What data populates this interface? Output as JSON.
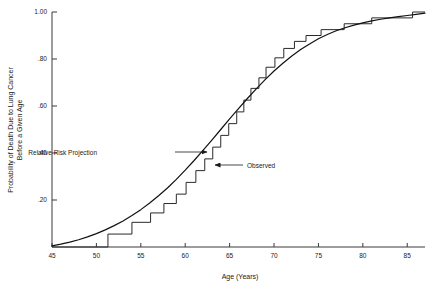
{
  "chart_data": {
    "type": "line",
    "title": "",
    "xlabel": "Age (Years)",
    "ylabel": "Probability of Death Due to Lung Cancer Before a Given Age",
    "ylabel_line1": "Probability of Death Due to Lung Cancer",
    "ylabel_line2": "Before a Given Age",
    "xlim": [
      45,
      87
    ],
    "ylim": [
      0,
      1.0
    ],
    "grid": false,
    "legend_position": "none",
    "xticks": [
      45,
      50,
      55,
      60,
      65,
      70,
      75,
      80,
      85
    ],
    "xtick_labels": [
      "45",
      "50",
      "55",
      "60",
      "65",
      "70",
      "75",
      "80",
      "85"
    ],
    "yticks": [
      0.2,
      0.4,
      0.6,
      0.8,
      1.0
    ],
    "ytick_labels": [
      ".20",
      ".40",
      ".60",
      ".80",
      "1.00"
    ],
    "series": [
      {
        "name": "Relative Risk Projection",
        "style": "smooth",
        "color": "#111111",
        "x": [
          45,
          46,
          47,
          48,
          49,
          50,
          51,
          52,
          53,
          54,
          55,
          56,
          57,
          58,
          59,
          60,
          61,
          62,
          63,
          64,
          65,
          66,
          67,
          68,
          69,
          70,
          71,
          72,
          73,
          74,
          75,
          76,
          77,
          78,
          79,
          80,
          81,
          82,
          83,
          84,
          85,
          86,
          87
        ],
        "y": [
          0.005,
          0.012,
          0.021,
          0.031,
          0.043,
          0.057,
          0.073,
          0.091,
          0.111,
          0.134,
          0.159,
          0.187,
          0.218,
          0.251,
          0.288,
          0.327,
          0.368,
          0.411,
          0.455,
          0.5,
          0.545,
          0.589,
          0.632,
          0.673,
          0.712,
          0.749,
          0.782,
          0.813,
          0.84,
          0.864,
          0.886,
          0.904,
          0.92,
          0.933,
          0.944,
          0.954,
          0.962,
          0.969,
          0.975,
          0.98,
          0.985,
          0.99,
          0.995
        ]
      },
      {
        "name": "Observed",
        "style": "step",
        "color": "#2a2a2a",
        "x": [
          45,
          51.3,
          51.3,
          54.0,
          54.0,
          56.1,
          56.1,
          57.6,
          57.6,
          59.0,
          59.0,
          60.1,
          60.1,
          61.2,
          61.2,
          62.2,
          62.2,
          63.1,
          63.1,
          64.0,
          64.0,
          64.9,
          64.9,
          65.8,
          65.8,
          66.6,
          66.6,
          67.4,
          67.4,
          68.3,
          68.3,
          69.1,
          69.1,
          70.1,
          70.1,
          71.1,
          71.1,
          72.3,
          72.3,
          73.6,
          73.6,
          75.3,
          75.3,
          77.9,
          77.9,
          81.0,
          81.0,
          85.6,
          85.6,
          87.0
        ],
        "y": [
          0.0,
          0.0,
          0.055,
          0.055,
          0.105,
          0.105,
          0.145,
          0.145,
          0.185,
          0.185,
          0.225,
          0.225,
          0.275,
          0.275,
          0.325,
          0.325,
          0.375,
          0.375,
          0.425,
          0.425,
          0.475,
          0.475,
          0.525,
          0.525,
          0.575,
          0.575,
          0.625,
          0.625,
          0.675,
          0.675,
          0.72,
          0.72,
          0.765,
          0.765,
          0.805,
          0.805,
          0.845,
          0.845,
          0.875,
          0.875,
          0.9,
          0.9,
          0.925,
          0.925,
          0.95,
          0.95,
          0.975,
          0.975,
          1.0,
          1.0
        ]
      }
    ],
    "annotations": [
      {
        "name": "relative-risk-projection",
        "text": "Relative Risk Projection",
        "text_x": 97,
        "text_y": 155,
        "arrow_from_x": 175,
        "arrow_from_y": 152,
        "arrow_to_x": 207,
        "arrow_to_y": 152
      },
      {
        "name": "observed",
        "text": "Observed",
        "text_x": 247,
        "text_y": 168,
        "arrow_from_x": 243,
        "arrow_from_y": 165,
        "arrow_to_x": 215,
        "arrow_to_y": 165
      }
    ]
  }
}
